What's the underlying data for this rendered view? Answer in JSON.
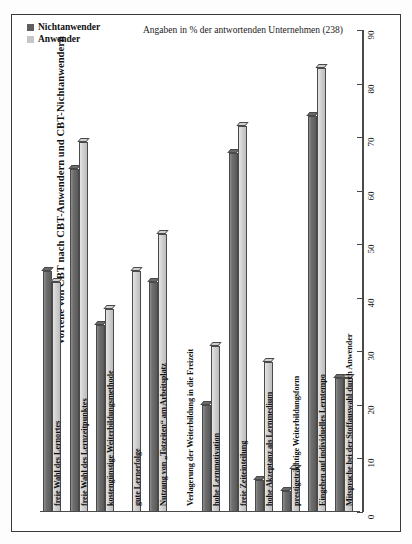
{
  "chart_data": {
    "type": "bar",
    "title": "Vorteile von CBT nach CBT-Anwendern und CBT-Nichtanwendern",
    "subtitle": "Angaben in % der antwortenden Unternehmen (238)",
    "orientation": "vertical-bars-rotated-labels",
    "xlabel": "",
    "ylabel": "",
    "ylim": [
      0,
      90
    ],
    "yticks": [
      0,
      10,
      20,
      30,
      40,
      50,
      60,
      70,
      80,
      90
    ],
    "grid": false,
    "legend_position": "top-left",
    "categories": [
      "freie Wahl des Lernortes",
      "freie Wahl des Lernzeitpunktes",
      "kostengünstige Weiterbildungsmethode",
      "gute Lernerfolge",
      "Nutzung von „Totzeiten“ am Arbeitsplatz",
      "Verlagerung der Weiterbildung in die Freizeit",
      "hohe Lernmotivation",
      "freie Zeiteinteilung",
      "hohe Akzeptanz als Lernmedium",
      "prestigeträchtige Weiterbildungsform",
      "Eingehen auf individuelles Lerntempo",
      "Mitsprache bei der Stoffauswahl durch Anwender"
    ],
    "series": [
      {
        "name": "Nichtanwender",
        "color": "#5e5e5e",
        "values": [
          45,
          64,
          35,
          0,
          43,
          0,
          20,
          67,
          6,
          4,
          74,
          25
        ]
      },
      {
        "name": "Anwender",
        "color": "#c6c6c6",
        "values": [
          43,
          69,
          38,
          45,
          52,
          0,
          31,
          72,
          28,
          8,
          83,
          25
        ]
      }
    ]
  },
  "legend": {
    "items": [
      {
        "label": "Nichtanwender",
        "swatch": "dark-gray-swatch"
      },
      {
        "label": "Anwender",
        "swatch": "light-gray-swatch"
      }
    ]
  },
  "axis": {
    "tick_labels": [
      "0",
      "10",
      "20",
      "30",
      "40",
      "50",
      "60",
      "70",
      "80",
      "90"
    ]
  }
}
